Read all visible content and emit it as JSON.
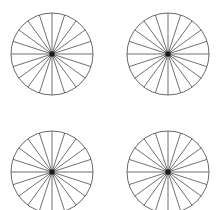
{
  "canvas": {
    "width": 221,
    "height": 210,
    "background_color": "#ffffff"
  },
  "figure": {
    "rows": 2,
    "columns": 2,
    "item_count": 4
  },
  "wheel_style": {
    "spoke_count": 20,
    "spokes_per_quadrant": 5,
    "angle_step_degrees": 18,
    "radius": 41,
    "rim_stroke_color": "#595959",
    "rim_stroke_width": 0.9,
    "spoke_stroke_color": "#4d4d4d",
    "spoke_stroke_width": 0.8,
    "hub_color": "#1a1a1a",
    "hub_size": 5,
    "hub_shape": "square"
  },
  "wheels": [
    {
      "name": "wheel-top-left",
      "position": "top-left",
      "cell_left": 0,
      "cell_top": 0,
      "center_x": 52,
      "center_y": 54,
      "clipped": false
    },
    {
      "name": "wheel-top-right",
      "position": "top-right",
      "cell_left": 111,
      "cell_top": 0,
      "center_x": 57,
      "center_y": 54,
      "clipped": false
    },
    {
      "name": "wheel-bottom-left",
      "position": "bottom-left",
      "cell_left": 0,
      "cell_top": 118,
      "center_x": 52,
      "center_y": 54,
      "clipped": true
    },
    {
      "name": "wheel-bottom-right",
      "position": "bottom-right",
      "cell_left": 111,
      "cell_top": 118,
      "center_x": 57,
      "center_y": 54,
      "clipped": true
    }
  ]
}
